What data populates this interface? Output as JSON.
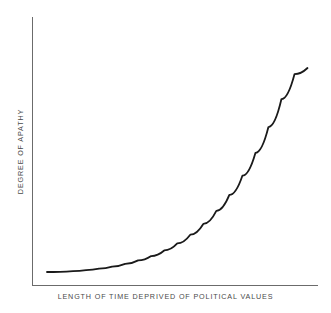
{
  "chart_data": {
    "type": "line",
    "title": "",
    "subtitle": "",
    "xlabel": "LENGTH OF TIME DEPRIVED OF POLITICAL VALUES",
    "ylabel": "DEGREE OF APATHY",
    "xlabel_text": "LENGTH OF TIME DEPRIVED OF POLITICAL VALUES",
    "ylabel_text": "DEGREE OF APATHY",
    "x_tick_labels": [],
    "y_tick_labels": [],
    "grid": false,
    "legend": null,
    "legend_position": "none",
    "xlim": [
      0,
      100
    ],
    "ylim": [
      0,
      100
    ],
    "annotations": [],
    "series": [
      {
        "name": "apathy-curve",
        "shape": "exponential-increasing",
        "color": "#1a1a1a",
        "line_width": 1.8,
        "x": [
          0,
          5,
          10,
          15,
          20,
          25,
          30,
          35,
          40,
          45,
          50,
          55,
          60,
          65,
          70,
          75,
          80,
          85,
          90,
          95,
          100
        ],
        "y": [
          1.5,
          1.6,
          1.9,
          2.4,
          3.1,
          4.1,
          5.4,
          7.1,
          9.2,
          11.9,
          15.3,
          19.5,
          24.7,
          31.0,
          38.7,
          48.0,
          59.0,
          71.5,
          85.0,
          97.0,
          100.0
        ]
      }
    ],
    "axes": {
      "color": "#6b6b6b",
      "line_width": 1,
      "spines": [
        "left",
        "bottom"
      ],
      "origin_px": [
        32,
        285
      ],
      "x_end_px": [
        318,
        285
      ],
      "y_top_px": [
        32,
        17
      ]
    },
    "curve_path_px": "M 47 272 C 80 270.5, 120 266, 160 258 C 200 248, 232 228, 262 192 C 282 166, 296 128, 303 96 C 306 82, 307 73, 307.5 68",
    "background": "#ffffff"
  },
  "figure": {
    "width": 331,
    "height": 313
  }
}
